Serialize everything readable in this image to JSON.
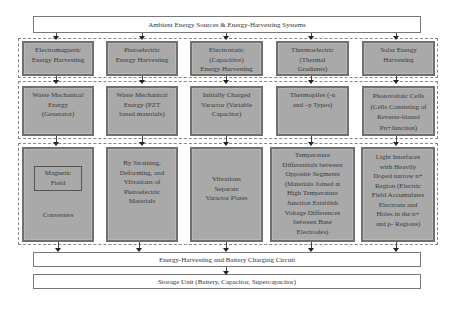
{
  "title": "Ambient Energy Sources & Energy-Harvesting Systems",
  "rows": [
    {
      "name": "harvesting-types",
      "cells": [
        {
          "lines": [
            "Electromagnetic",
            "Energy Harvesting"
          ]
        },
        {
          "lines": [
            "Piezoelectric",
            "Energy Harvesting"
          ]
        },
        {
          "lines": [
            "Electrostatic",
            "(Capacitive)",
            "Energy Harvesting"
          ]
        },
        {
          "lines": [
            "Thermoelectric",
            "(Thermal",
            "Gradients)"
          ]
        },
        {
          "lines": [
            "Solar Energy",
            "Harvesting"
          ]
        }
      ]
    },
    {
      "name": "sources",
      "cells": [
        {
          "lines": [
            "Waste Mechanical",
            "Energy",
            "(Generator)"
          ]
        },
        {
          "lines": [
            "Waste Mechanical",
            "Energy (PZT",
            "based materials)"
          ]
        },
        {
          "lines": [
            "Initially Charged",
            "Varactor (Variable",
            "Capacitor)"
          ]
        },
        {
          "lines": [
            "Thermopiles (-n",
            "and –p Types)"
          ]
        },
        {
          "lines": [
            "Photovoltaic Cells",
            "(Cells Consisting of",
            "Reverse-biased",
            "Pn+Junction)"
          ]
        }
      ]
    },
    {
      "name": "mechanisms",
      "cells": [
        {
          "inner_box": [
            "Magnetic",
            "Field"
          ],
          "lines": [
            "Converters"
          ]
        },
        {
          "lines": [
            "By Straining,",
            "Deforming, and",
            "Vibrations of",
            "Piezoelectric",
            "Materials"
          ]
        },
        {
          "lines": [
            "Vibrations",
            "Separate",
            "Varactor Plates"
          ]
        },
        {
          "lines": [
            "Temperature",
            "Differentials between",
            "Opposite Segments",
            "(Materials Joined at",
            "High Temperature",
            "Junction Establish",
            "Voltage Differences",
            "between Base",
            "Electrodes)"
          ]
        },
        {
          "lines": [
            "Light Interfaces",
            "with Heavily",
            "Doped narrow n+",
            "Region (Electric",
            "Field Accumulates",
            "Electrons and",
            "Holes in the n+",
            "and p- Regions)"
          ]
        }
      ]
    }
  ],
  "circuit": "Energy-Harvesting and Battery Charging Circuit",
  "storage": "Storage Unit (Battery, Capacitor, Supercapacitor)",
  "colors": {
    "cell_fill": "#a9a9a9",
    "cell_border": "#6f6f6f",
    "box_border": "#777777",
    "background": "#ffffff"
  }
}
